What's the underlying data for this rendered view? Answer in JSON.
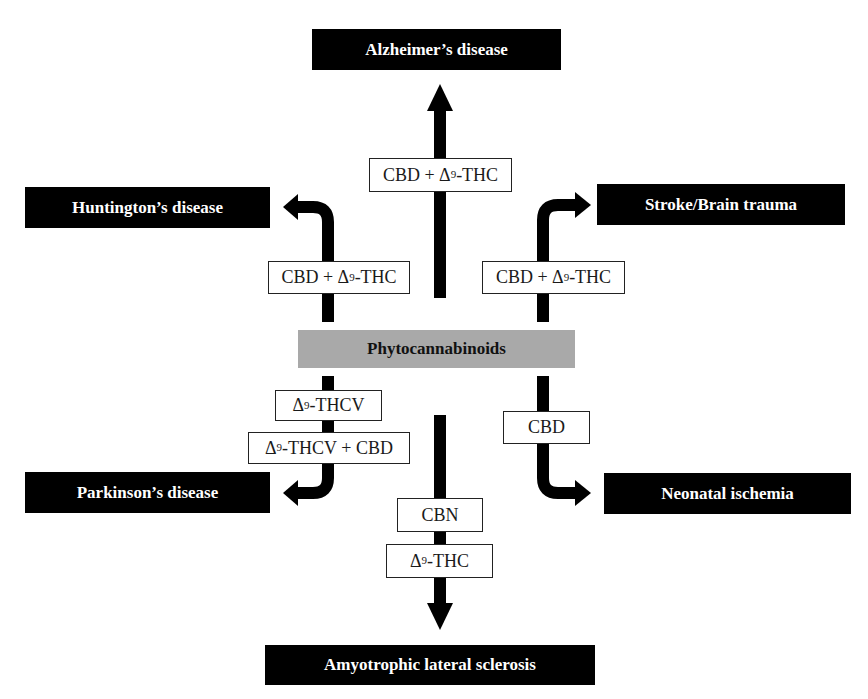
{
  "center": {
    "label": "Phytocannabinoids",
    "color": "#a9a9a9"
  },
  "diseases": {
    "alzheimers": "Alzheimer’s disease",
    "huntingtons": "Huntington’s disease",
    "stroke": "Stroke/Brain trauma",
    "parkinsons": "Parkinson’s disease",
    "neonatal": "Neonatal ischemia",
    "als": "Amyotrophic lateral sclerosis"
  },
  "labels": {
    "alzheimers": {
      "pre": "CBD + Δ",
      "sup": "9",
      "post": "-THC"
    },
    "huntingtons": {
      "pre": "CBD + Δ",
      "sup": "9",
      "post": "-THC"
    },
    "stroke": {
      "pre": "CBD + Δ",
      "sup": "9",
      "post": "-THC"
    },
    "parkinsons_1": {
      "pre": "Δ",
      "sup": "9",
      "post": "-THCV"
    },
    "parkinsons_2": {
      "pre": "Δ",
      "sup": "9",
      "post": "-THCV + CBD"
    },
    "neonatal": {
      "pre": "CBD",
      "sup": "",
      "post": ""
    },
    "als_1": {
      "pre": "CBN",
      "sup": "",
      "post": ""
    },
    "als_2": {
      "pre": "Δ",
      "sup": "9",
      "post": "-THC"
    }
  },
  "colors": {
    "disease_box": "#000000",
    "disease_text": "#ffffff",
    "arrow": "#000000",
    "label_border": "#222222"
  }
}
